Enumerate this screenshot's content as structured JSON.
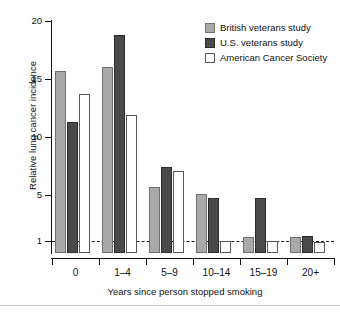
{
  "chart_data": {
    "type": "bar",
    "title": "",
    "subtitle": "",
    "xlabel": "Years since person stopped smoking",
    "ylabel": "Relative lung cancer incidence",
    "categories": [
      "0",
      "1–4",
      "5–9",
      "10–14",
      "15–19",
      "20+"
    ],
    "series": [
      {
        "name": "British veterans study",
        "color": "#a9a9a9",
        "values": [
          15.7,
          16.0,
          5.7,
          5.05,
          1.4,
          1.4
        ]
      },
      {
        "name": "U.S. veterans study",
        "color": "#4a4a4a",
        "values": [
          11.3,
          18.8,
          7.4,
          4.75,
          4.75,
          1.5
        ]
      },
      {
        "name": "American Cancer Society",
        "color": "#ffffff",
        "values": [
          13.7,
          11.9,
          7.1,
          1.0,
          1.0,
          0.95
        ]
      }
    ],
    "ytick_values": [
      1,
      5,
      10,
      15,
      20
    ],
    "ytick_labels": [
      "1",
      "5",
      "10",
      "15",
      "20"
    ],
    "ylim": [
      0,
      20
    ],
    "reference_line": 1,
    "reference_line_style": "dashed",
    "grid": false,
    "legend_position": "top-right"
  },
  "legend": {
    "entries": [
      {
        "label": "British veterans study"
      },
      {
        "label": "U.S. veterans study"
      },
      {
        "label": "American Cancer Society"
      }
    ]
  },
  "axes": {
    "y_title": "Relative lung cancer incidence",
    "x_title": "Years since person stopped smoking"
  }
}
